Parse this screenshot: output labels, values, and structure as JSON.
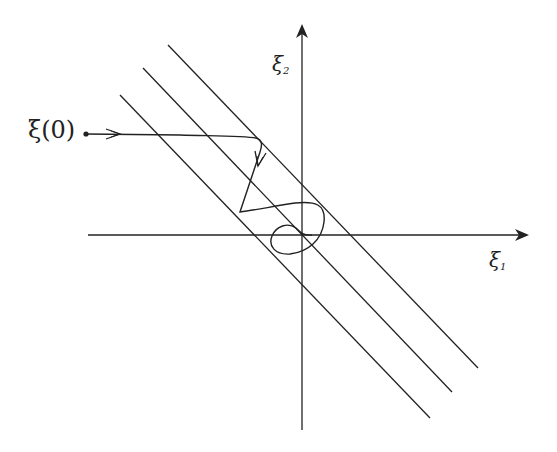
{
  "diagram": {
    "type": "phase-plane-trajectory",
    "axes": {
      "horizontal_label": "ξ",
      "horizontal_subscript": "1",
      "vertical_label": "ξ",
      "vertical_subscript": "2"
    },
    "initial_point_label": "ξ(0)",
    "stroke_color": "#222222",
    "background": "#ffffff",
    "parallel_lines_count": 3
  }
}
